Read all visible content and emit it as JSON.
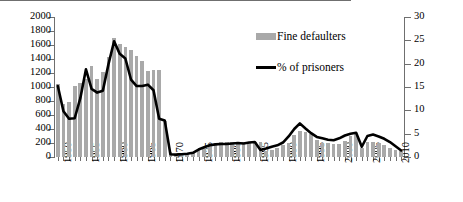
{
  "chart_data": {
    "type": "bar",
    "title": "",
    "xlabel": "",
    "ylabel": "",
    "y_left": {
      "label": "",
      "min": 0,
      "max": 2000,
      "step": 200,
      "ticks": [
        "0",
        "200",
        "400",
        "600",
        "800",
        "1000",
        "1200",
        "1400",
        "1600",
        "1800",
        "2000"
      ]
    },
    "y_right": {
      "label": "",
      "min": 0,
      "max": 30,
      "step": 5,
      "ticks": [
        "0",
        "5",
        "10",
        "15",
        "20",
        "25",
        "30"
      ]
    },
    "grid": false,
    "legend_position": "top-center",
    "x": [
      1950,
      1951,
      1952,
      1953,
      1954,
      1955,
      1956,
      1957,
      1958,
      1959,
      1960,
      1961,
      1962,
      1963,
      1964,
      1965,
      1966,
      1967,
      1968,
      1969,
      1970,
      1971,
      1972,
      1973,
      1974,
      1975,
      1976,
      1977,
      1978,
      1979,
      1980,
      1981,
      1982,
      1983,
      1984,
      1985,
      1986,
      1987,
      1988,
      1989,
      1990,
      1991,
      1992,
      1993,
      1994,
      1995,
      1996,
      1997,
      1998,
      1999,
      2000,
      2001,
      2002,
      2003,
      2004,
      2005,
      2006,
      2007,
      2008,
      2009,
      2010,
      2011
    ],
    "xtick_labels": [
      "1950",
      "1955",
      "1960",
      "1965",
      "1970",
      "1975",
      "1980",
      "1985",
      "1990",
      "1995",
      "2000",
      "2005",
      "2010"
    ],
    "xtick_values": [
      1950,
      1955,
      1960,
      1965,
      1970,
      1975,
      1980,
      1985,
      1990,
      1995,
      2000,
      2005,
      2010
    ],
    "series": [
      {
        "name": "Fine defaulters",
        "type": "bar",
        "axis": "left",
        "color": "#a9a9a9",
        "values": [
          1050,
          760,
          790,
          1020,
          1060,
          1110,
          1300,
          1110,
          1210,
          1430,
          1700,
          1620,
          1570,
          1530,
          1450,
          1370,
          1230,
          1240,
          1240,
          520,
          70,
          30,
          40,
          45,
          60,
          95,
          140,
          180,
          200,
          215,
          215,
          215,
          215,
          215,
          215,
          215,
          215,
          90,
          105,
          135,
          170,
          205,
          310,
          370,
          360,
          330,
          250,
          205,
          195,
          190,
          185,
          230,
          300,
          330,
          130,
          210,
          215,
          195,
          165,
          130,
          95,
          90
        ]
      },
      {
        "name": "% of prisoners",
        "type": "line",
        "axis": "right",
        "color": "#000000",
        "values": [
          15.2,
          9.8,
          8.2,
          8.3,
          12.6,
          18.8,
          14.6,
          13.8,
          14.2,
          19.9,
          24.8,
          22.1,
          21.1,
          16.6,
          15.2,
          15.2,
          15.5,
          14.3,
          8.2,
          7.8,
          0.6,
          0.5,
          0.6,
          0.7,
          0.9,
          1.6,
          2.1,
          2.5,
          2.7,
          2.8,
          2.8,
          2.9,
          3.0,
          2.9,
          3.1,
          3.2,
          1.5,
          1.8,
          2.2,
          2.5,
          3.1,
          4.4,
          6.0,
          7.2,
          6.1,
          5.1,
          4.3,
          4.0,
          3.7,
          3.6,
          4.0,
          4.6,
          5.0,
          5.2,
          2.2,
          4.5,
          4.8,
          4.4,
          3.9,
          3.2,
          2.3,
          1.4
        ]
      }
    ],
    "legend": [
      {
        "label": "Fine defaulters",
        "marker": "bar-swatch",
        "color": "#a9a9a9"
      },
      {
        "label": "% of prisoners",
        "marker": "line-swatch",
        "color": "#000000"
      }
    ]
  }
}
